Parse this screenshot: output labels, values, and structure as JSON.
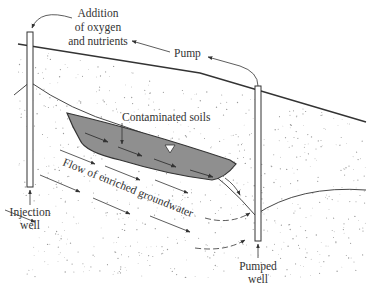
{
  "diagram": {
    "labels": {
      "addition_line1": "Addition",
      "addition_line2": "of oxygen",
      "addition_line3": "and nutrients",
      "pump": "Pump",
      "contaminated_soils": "Contaminated soils",
      "flow": "Flow of enriched groundwater",
      "injection_line1": "Injection",
      "injection_line2": "well",
      "pumped_line1": "Pumped",
      "pumped_line2": "well"
    },
    "colors": {
      "contaminated_fill": "#8f8f8f",
      "soil_dots": "#9a9a9a",
      "lines": "#333333"
    }
  }
}
